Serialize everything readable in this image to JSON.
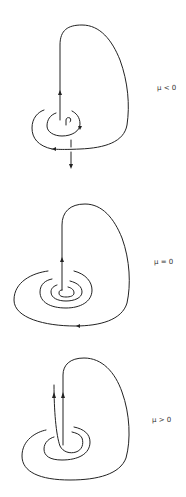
{
  "figure": {
    "panels": [
      {
        "id": "mu-negative",
        "label": "μ < 0"
      },
      {
        "id": "mu-zero",
        "label": "μ = 0"
      },
      {
        "id": "mu-positive",
        "label": "μ > 0"
      }
    ],
    "colors": {
      "stroke": "#222222",
      "background": "#ffffff",
      "label": "#333333"
    }
  }
}
